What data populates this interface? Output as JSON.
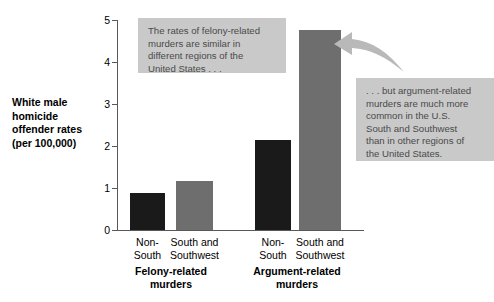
{
  "chart_data": {
    "type": "bar",
    "title": "",
    "xlabel": "",
    "ylabel": "White male homicide offender rates (per 100,000)",
    "ylim": [
      0,
      5
    ],
    "yticks": [
      "0",
      "1",
      "2",
      "3",
      "4",
      "5"
    ],
    "grid": false,
    "legend": "none",
    "groups": [
      {
        "label_line1": "Felony-related",
        "label_line2": "murders",
        "bars": [
          {
            "category_line1": "Non-",
            "category_line2": "South",
            "value": 0.88,
            "color": "#1a1a1a"
          },
          {
            "category_line1": "South and",
            "category_line2": "Southwest",
            "value": 1.17,
            "color": "#6e6e6e"
          }
        ]
      },
      {
        "label_line1": "Argument-related",
        "label_line2": "murders",
        "bars": [
          {
            "category_line1": "Non-",
            "category_line2": "South",
            "value": 2.15,
            "color": "#1a1a1a"
          },
          {
            "category_line1": "South and",
            "category_line2": "Southwest",
            "value": 4.77,
            "color": "#6e6e6e"
          }
        ]
      }
    ],
    "categories": [
      "Non-South",
      "South and Southwest",
      "Non-South",
      "South and Southwest"
    ],
    "values": [
      0.88,
      1.17,
      2.15,
      4.77
    ],
    "annotations": [
      {
        "id": "left",
        "lines": [
          "The rates of felony-related",
          "murders are similar in",
          "different regions of the",
          "United States . . ."
        ]
      },
      {
        "id": "right",
        "lines": [
          ". . . but argument-related",
          "murders are much more",
          "common in the U.S.",
          "South and Southwest",
          "than in other regions of",
          "the United States."
        ]
      }
    ]
  },
  "axis": {
    "y_title_lines": [
      "White male",
      "homicide",
      "offender rates",
      "(per 100,000)"
    ],
    "ticks": [
      {
        "label": "5"
      },
      {
        "label": "4"
      },
      {
        "label": "3"
      },
      {
        "label": "2"
      },
      {
        "label": "1"
      },
      {
        "label": "0"
      }
    ]
  },
  "colors": {
    "bar_black": "#1a1a1a",
    "bar_gray": "#6e6e6e",
    "callout_bg": "#c9c9c9",
    "callout_text": "#4a4a4a",
    "axis": "#58585a",
    "arrow": "#b4b4b4"
  }
}
